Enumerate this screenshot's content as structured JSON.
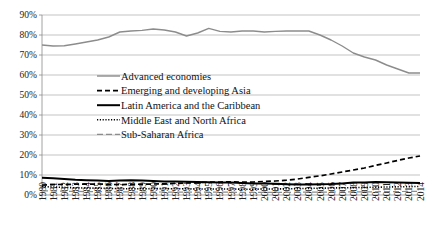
{
  "chart_data": {
    "type": "line",
    "title": "",
    "xlabel": "",
    "ylabel": "",
    "grid": true,
    "legend_position": "center-left",
    "ylim": [
      0,
      90
    ],
    "ytick_labels": [
      "0%",
      "10%",
      "20%",
      "30%",
      "40%",
      "50%",
      "60%",
      "70%",
      "80%",
      "90%"
    ],
    "ytick_values": [
      0,
      10,
      20,
      30,
      40,
      50,
      60,
      70,
      80,
      90
    ],
    "categories": [
      "1980",
      "1981",
      "1982",
      "1983",
      "1984",
      "1985",
      "1986",
      "1987",
      "1988",
      "1989",
      "1990",
      "1991",
      "1992",
      "1993",
      "1994",
      "1995",
      "1996",
      "1997",
      "1998",
      "1999",
      "2000",
      "2001",
      "2002",
      "2003",
      "2004",
      "2005",
      "2006",
      "2007",
      "2008",
      "2009",
      "2010",
      "2011",
      "2012",
      "2013",
      "2014"
    ],
    "series": [
      {
        "name": "Advanced economies",
        "style": "solid",
        "color": "#8c8c8c",
        "width": 1.4,
        "dash": "none",
        "values": [
          75,
          74.5,
          74.6,
          75.5,
          76.5,
          77.5,
          79,
          81.5,
          82,
          82.3,
          83,
          82.5,
          81.5,
          79.5,
          81,
          83.3,
          81.8,
          81.5,
          82,
          82,
          81.5,
          81.8,
          82,
          82,
          82,
          80,
          77.5,
          74.5,
          71,
          69,
          67.5,
          65,
          63,
          61,
          61
        ]
      },
      {
        "name": "Emerging and developing Asia",
        "style": "dashed",
        "color": "#000000",
        "width": 1.7,
        "dash": "5,3",
        "values": [
          5,
          5.2,
          5.3,
          5.4,
          5.4,
          5.5,
          5.3,
          5.2,
          5.3,
          5.4,
          5.5,
          5.6,
          5.8,
          6,
          6.2,
          6.4,
          6.5,
          6.6,
          6.4,
          6.5,
          6.8,
          7,
          7.4,
          8,
          8.8,
          9.6,
          10.5,
          11.5,
          12.5,
          13.5,
          14.8,
          16,
          17.3,
          18.5,
          19.5
        ]
      },
      {
        "name": "Latin America and the Caribbean",
        "style": "solid",
        "color": "#000000",
        "width": 2.0,
        "dash": "none",
        "values": [
          8.6,
          8.4,
          8,
          7.6,
          7.4,
          7.2,
          7,
          7.2,
          7.4,
          7.2,
          7,
          6.8,
          6.7,
          6.6,
          6.5,
          6.4,
          6.3,
          6.2,
          6,
          5.8,
          5.7,
          5.6,
          5.4,
          5.3,
          5.3,
          5.4,
          5.5,
          5.8,
          6.2,
          6.3,
          6.5,
          6.4,
          6.3,
          6.1,
          6.0
        ]
      },
      {
        "name": "Middle East and North Africa",
        "style": "dotted",
        "color": "#000000",
        "width": 1.6,
        "dash": "1.2,1.6",
        "values": [
          4.2,
          4,
          3.8,
          3.6,
          3.5,
          3.4,
          3.3,
          3.2,
          3.1,
          3.1,
          3.2,
          3.2,
          3.1,
          3.1,
          3,
          3,
          3,
          3,
          2.9,
          2.9,
          3,
          3,
          3.1,
          3.2,
          3.3,
          3.4,
          3.5,
          3.6,
          3.7,
          3.8,
          3.9,
          4,
          4.1,
          4.2,
          4.3
        ]
      },
      {
        "name": "Sub-Saharan Africa",
        "style": "dashed",
        "color": "#8c8c8c",
        "width": 1.2,
        "dash": "6,3",
        "values": [
          2.1,
          2,
          1.9,
          1.8,
          1.7,
          1.7,
          1.6,
          1.6,
          1.5,
          1.5,
          1.5,
          1.5,
          1.4,
          1.4,
          1.4,
          1.4,
          1.4,
          1.4,
          1.3,
          1.3,
          1.3,
          1.3,
          1.3,
          1.4,
          1.4,
          1.4,
          1.5,
          1.5,
          1.6,
          1.6,
          1.6,
          1.7,
          1.7,
          1.8,
          1.8
        ]
      }
    ]
  },
  "legend": {
    "items": [
      {
        "label": "Advanced economies"
      },
      {
        "label": "Emerging and developing Asia"
      },
      {
        "label": "Latin America and the Caribbean"
      },
      {
        "label": "Middle East and North Africa"
      },
      {
        "label": "Sub-Saharan Africa"
      }
    ]
  }
}
